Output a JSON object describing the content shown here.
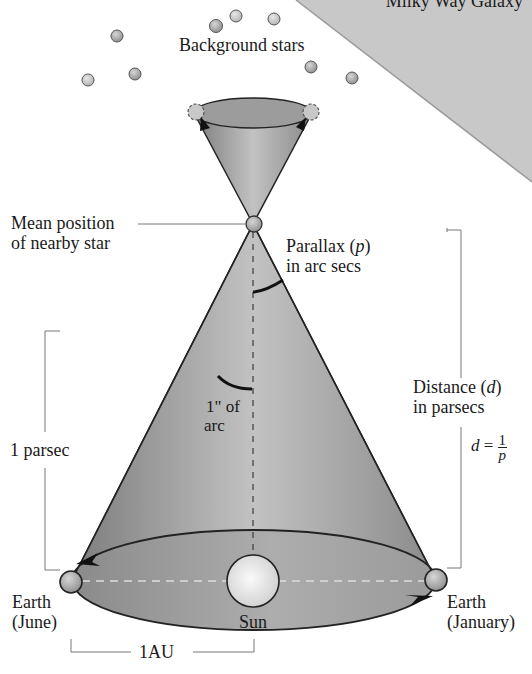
{
  "figure": {
    "title_region": "Milky Way Galaxy",
    "labels": {
      "background_stars": "Background stars",
      "mean_position_line1": "Mean position",
      "mean_position_line2": "of nearby star",
      "parallax_line1_prefix": "Parallax (",
      "parallax_symbol": "p",
      "parallax_line1_suffix": ")",
      "parallax_line2": "in arc secs",
      "one_arcsec_line1": "1\" of",
      "one_arcsec_line2": "arc",
      "one_parsec": "1 parsec",
      "distance_line1_prefix": "Distance (",
      "distance_symbol": "d",
      "distance_line1_suffix": ")",
      "distance_line2": "in parsecs",
      "formula_lhs": "d",
      "formula_eq": " = ",
      "formula_num": "1",
      "formula_den": "p",
      "earth_june_line1": "Earth",
      "earth_june_line2": "(June)",
      "sun": "Sun",
      "earth_january_line1": "Earth",
      "earth_january_line2": "(January)",
      "one_au": "1AU"
    },
    "colors": {
      "galaxy_fill": "#c8c8c8",
      "cone_fill_dark": "#8a8a8a",
      "cone_fill_light": "#c4c4c4",
      "star_fill": "#b5b5b5",
      "sun_fill": "#eeeeee",
      "outline": "#222222",
      "bracket_line": "#777777"
    }
  }
}
